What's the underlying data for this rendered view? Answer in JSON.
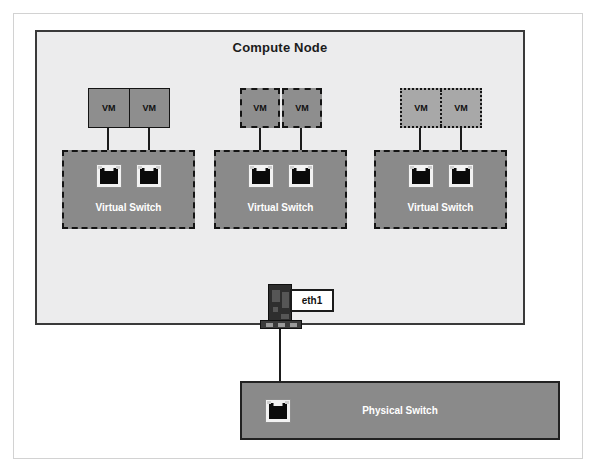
{
  "diagram": {
    "compute_node": {
      "title": "Compute Node",
      "vm_groups": [
        {
          "style": "solid",
          "vms": [
            {
              "label": "VM"
            },
            {
              "label": "VM"
            }
          ],
          "virtual_switch": {
            "label": "Virtual Switch",
            "ports": [
              {
                "name": "rj45-port-icon"
              },
              {
                "name": "rj45-port-icon"
              }
            ]
          }
        },
        {
          "style": "dashed",
          "vms": [
            {
              "label": "VM"
            },
            {
              "label": "VM"
            }
          ],
          "virtual_switch": {
            "label": "Virtual Switch",
            "ports": [
              {
                "name": "rj45-port-icon"
              },
              {
                "name": "rj45-port-icon"
              }
            ]
          }
        },
        {
          "style": "dotted",
          "vms": [
            {
              "label": "VM"
            },
            {
              "label": "VM"
            }
          ],
          "virtual_switch": {
            "label": "Virtual Switch",
            "ports": [
              {
                "name": "rj45-port-icon"
              },
              {
                "name": "rj45-port-icon"
              }
            ]
          }
        }
      ],
      "nic": {
        "icon": "network-card-icon",
        "interface_label": "eth1"
      }
    },
    "physical_switch": {
      "label": "Physical Switch",
      "port": {
        "name": "rj45-port-icon"
      }
    },
    "colors": {
      "compute_node_fill": "#ececed",
      "compute_node_border": "#3a3a3a",
      "vm_fill_dark": "#8e8e8e",
      "vm_fill_light": "#a8a8a8",
      "switch_fill": "#8a8a8a",
      "switch_border": "#141414",
      "label_text": "#ffffff",
      "nic_fill": "#2e2e2e",
      "link_line": "#1b1b1b"
    }
  }
}
